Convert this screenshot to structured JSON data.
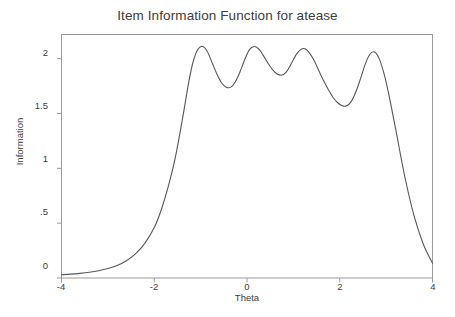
{
  "chart_data": {
    "type": "line",
    "title": "Item Information Function for atease",
    "xlabel": "Theta",
    "ylabel": "Information",
    "xlim": [
      -4,
      4
    ],
    "ylim": [
      0,
      2.22
    ],
    "xticks": [
      -4,
      -2,
      0,
      2,
      4
    ],
    "xticklabels": [
      "-4",
      "-2",
      "0",
      "2",
      "4"
    ],
    "yticks": [
      0,
      0.5,
      1,
      1.5,
      2
    ],
    "yticklabels": [
      "0",
      ".5",
      "1",
      "1.5",
      "2"
    ],
    "grid": false,
    "legend": false,
    "line_color": "#575757",
    "axis_color": "#9a9a9a",
    "series": [
      {
        "name": "Information",
        "x": [
          -4.0,
          -3.8,
          -3.6,
          -3.4,
          -3.2,
          -3.0,
          -2.8,
          -2.6,
          -2.4,
          -2.2,
          -2.0,
          -1.85,
          -1.7,
          -1.55,
          -1.4,
          -1.25,
          -1.15,
          -1.05,
          -0.95,
          -0.85,
          -0.75,
          -0.65,
          -0.55,
          -0.45,
          -0.35,
          -0.25,
          -0.15,
          -0.05,
          0.05,
          0.15,
          0.25,
          0.35,
          0.45,
          0.55,
          0.65,
          0.75,
          0.85,
          0.95,
          1.05,
          1.15,
          1.25,
          1.35,
          1.45,
          1.55,
          1.65,
          1.75,
          1.85,
          1.95,
          2.05,
          2.15,
          2.25,
          2.35,
          2.45,
          2.55,
          2.65,
          2.75,
          2.85,
          2.95,
          3.05,
          3.2,
          3.4,
          3.6,
          3.8,
          4.0
        ],
        "y": [
          0.03,
          0.035,
          0.042,
          0.052,
          0.066,
          0.086,
          0.115,
          0.158,
          0.222,
          0.318,
          0.46,
          0.62,
          0.83,
          1.09,
          1.43,
          1.8,
          1.99,
          2.09,
          2.11,
          2.06,
          1.96,
          1.86,
          1.78,
          1.74,
          1.74,
          1.79,
          1.88,
          1.99,
          2.08,
          2.11,
          2.09,
          2.03,
          1.96,
          1.9,
          1.86,
          1.85,
          1.88,
          1.95,
          2.03,
          2.08,
          2.09,
          2.05,
          1.98,
          1.89,
          1.8,
          1.72,
          1.65,
          1.6,
          1.57,
          1.57,
          1.61,
          1.7,
          1.82,
          1.95,
          2.04,
          2.06,
          2.0,
          1.87,
          1.69,
          1.37,
          0.93,
          0.57,
          0.31,
          0.135
        ]
      }
    ]
  }
}
